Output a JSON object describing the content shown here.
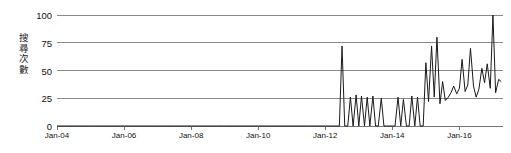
{
  "chart_data": {
    "type": "line",
    "title": "",
    "xlabel": "",
    "ylabel": "搜尋次數",
    "ylim": [
      0,
      100
    ],
    "grid": true,
    "legend": "none",
    "yticks": [
      0,
      25,
      50,
      75,
      100
    ],
    "ytick_labels": [
      "0",
      "25",
      "50",
      "75",
      "100"
    ],
    "xtick_labels": [
      "Jan-04",
      "Jan-06",
      "Jan-08",
      "Jan-10",
      "Jan-12",
      "Jan-14",
      "Jan-16"
    ],
    "xtick_values": [
      2004.0,
      2006.0,
      2008.0,
      2010.0,
      2012.0,
      2014.0,
      2016.0
    ],
    "xlim": [
      2004.0,
      2017.3
    ],
    "series": [
      {
        "name": "搜尋次數",
        "color": "#1a1a1a",
        "x": [
          2004.0,
          2004.25,
          2004.5,
          2004.75,
          2005.0,
          2005.25,
          2005.5,
          2005.75,
          2006.0,
          2006.25,
          2006.5,
          2006.75,
          2007.0,
          2007.25,
          2007.5,
          2007.75,
          2008.0,
          2008.25,
          2008.5,
          2008.75,
          2009.0,
          2009.25,
          2009.5,
          2009.75,
          2010.0,
          2010.25,
          2010.5,
          2010.75,
          2011.0,
          2011.25,
          2011.5,
          2011.75,
          2012.0,
          2012.25,
          2012.42,
          2012.5,
          2012.58,
          2012.67,
          2012.75,
          2012.83,
          2012.92,
          2013.0,
          2013.08,
          2013.17,
          2013.25,
          2013.33,
          2013.42,
          2013.5,
          2013.58,
          2013.67,
          2013.75,
          2013.83,
          2013.92,
          2014.0,
          2014.08,
          2014.17,
          2014.25,
          2014.33,
          2014.42,
          2014.5,
          2014.58,
          2014.67,
          2014.75,
          2014.83,
          2014.92,
          2015.0,
          2015.08,
          2015.17,
          2015.25,
          2015.33,
          2015.42,
          2015.5,
          2015.58,
          2015.67,
          2015.75,
          2015.83,
          2015.92,
          2016.0,
          2016.08,
          2016.17,
          2016.25,
          2016.33,
          2016.42,
          2016.5,
          2016.58,
          2016.67,
          2016.75,
          2016.83,
          2016.92,
          2017.0,
          2017.08,
          2017.17,
          2017.25
        ],
        "y": [
          0,
          0,
          0,
          0,
          0,
          0,
          0,
          0,
          0,
          0,
          0,
          0,
          0,
          0,
          0,
          0,
          0,
          0,
          0,
          0,
          0,
          0,
          0,
          0,
          0,
          0,
          0,
          0,
          0,
          0,
          0,
          0,
          0,
          0,
          0,
          72,
          0,
          0,
          26,
          0,
          28,
          0,
          27,
          0,
          26,
          0,
          27,
          0,
          0,
          25,
          0,
          0,
          0,
          0,
          0,
          26,
          0,
          24,
          0,
          0,
          27,
          0,
          26,
          0,
          0,
          57,
          22,
          72,
          26,
          80,
          20,
          40,
          23,
          26,
          30,
          36,
          29,
          34,
          60,
          31,
          37,
          70,
          36,
          26,
          33,
          52,
          39,
          56,
          34,
          100,
          30,
          42,
          40
        ]
      }
    ]
  }
}
